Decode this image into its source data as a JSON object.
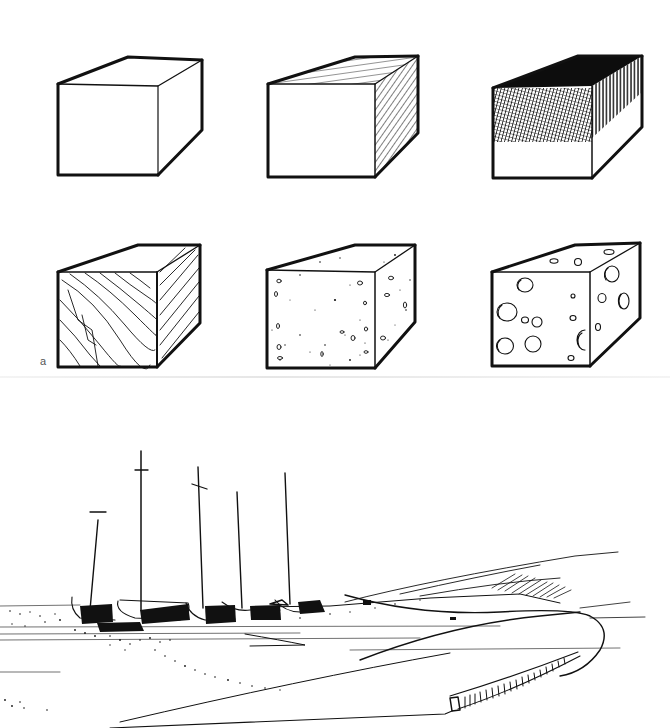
{
  "figure": {
    "label": "a",
    "ink_color": "#111111",
    "paper_color": "#ffffff"
  },
  "panel_a": {
    "rows": [
      {
        "cubes": [
          {
            "name": "cube-plain",
            "texture": "outline"
          },
          {
            "name": "cube-hatched",
            "texture": "line hatching on top and right faces"
          },
          {
            "name": "cube-crosshatched",
            "texture": "dense solid top, crosshatched upper front, vertical hatching right face"
          }
        ]
      },
      {
        "cubes": [
          {
            "name": "cube-woodgrain",
            "texture": "wood grain lines"
          },
          {
            "name": "cube-stippled",
            "texture": "stipple and pits (stone/concrete)"
          },
          {
            "name": "cube-holes",
            "texture": "circular holes (cheese/pumice)"
          }
        ]
      }
    ]
  },
  "panel_b": {
    "scene": "beach with sailboats",
    "boat_count": 5
  }
}
